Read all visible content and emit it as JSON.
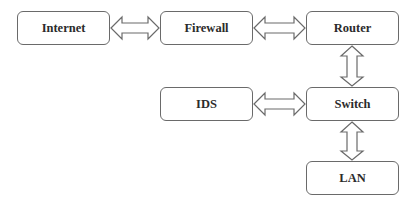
{
  "diagram": {
    "type": "network-topology",
    "nodes": [
      {
        "id": "internet",
        "label": "Internet"
      },
      {
        "id": "firewall",
        "label": "Firewall"
      },
      {
        "id": "router",
        "label": "Router"
      },
      {
        "id": "ids",
        "label": "IDS"
      },
      {
        "id": "switch",
        "label": "Switch"
      },
      {
        "id": "lan",
        "label": "LAN"
      }
    ],
    "edges": [
      {
        "from": "internet",
        "to": "firewall",
        "style": "double-headed-hollow-arrow"
      },
      {
        "from": "firewall",
        "to": "router",
        "style": "double-headed-hollow-arrow"
      },
      {
        "from": "router",
        "to": "switch",
        "style": "double-headed-hollow-arrow"
      },
      {
        "from": "ids",
        "to": "switch",
        "style": "double-headed-hollow-arrow"
      },
      {
        "from": "switch",
        "to": "lan",
        "style": "double-headed-hollow-arrow"
      }
    ],
    "colors": {
      "stroke": "#6a6a6a",
      "text": "#2b2b2b",
      "background": "#ffffff"
    }
  }
}
